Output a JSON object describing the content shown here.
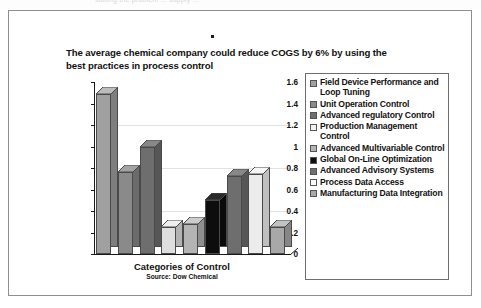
{
  "page": {
    "scan_artifact_text": "stating the problem ... supply ...",
    "top_marker": "•"
  },
  "chart_data": {
    "type": "bar",
    "title": "The average chemical company could reduce COGS by 6% by using the best practices in process control",
    "xlabel": "Categories of Control",
    "ylabel": "",
    "source": "Source: Dow Chemical",
    "ylim": [
      0,
      1.6
    ],
    "ytick_labels": [
      "0",
      "0.2",
      "0.4",
      "0.6",
      "0.8",
      "1",
      "1.2",
      "1.4",
      "1.6"
    ],
    "ytick_values": [
      0,
      0.2,
      0.4,
      0.6,
      0.8,
      1,
      1.2,
      1.4,
      1.6
    ],
    "grid": true,
    "legend_position": "right",
    "categories": [
      "Field Device Performance and Loop Tuning",
      "Unit Operation Control",
      "Advanced regulatory Control",
      "Production Management Control",
      "Advanced Multivariable Control",
      "Global On-Line Optimization",
      "Advanced Advisory Systems",
      "Process Data Access",
      "Manufacturing Data Integration"
    ],
    "values": [
      1.49,
      0.76,
      1.0,
      0.25,
      0.28,
      0.5,
      0.73,
      0.74,
      0.25
    ],
    "colors": [
      "#a0a0a0",
      "#8a8a8a",
      "#6e6e6e",
      "#dedede",
      "#b4b4b4",
      "#0d0d0d",
      "#6e6e6e",
      "#ececec",
      "#a8a8a8"
    ],
    "side_colors": [
      "#7e7e7e",
      "#6b6b6b",
      "#565656",
      "#b3b3b3",
      "#8f8f8f",
      "#0a0a0a",
      "#565656",
      "#bfbfbf",
      "#868686"
    ],
    "top_colors": [
      "#bcbcbc",
      "#a3a3a3",
      "#888888",
      "#efefef",
      "#cccccc",
      "#2a2a2a",
      "#888888",
      "#f7f7f7",
      "#c2c2c2"
    ]
  },
  "legend": {
    "items": [
      {
        "label": "Field Device Performance and Loop Tuning",
        "color": "#a0a0a0"
      },
      {
        "label": "Unit Operation Control",
        "color": "#8a8a8a"
      },
      {
        "label": "Advanced regulatory Control",
        "color": "#6e6e6e"
      },
      {
        "label": "Production Management Control",
        "color": "#f2f2f2"
      },
      {
        "label": "Advanced Multivariable Control",
        "color": "#b4b4b4"
      },
      {
        "label": "Global On-Line Optimization",
        "color": "#0d0d0d"
      },
      {
        "label": "Advanced Advisory Systems",
        "color": "#6e6e6e"
      },
      {
        "label": "Process Data Access",
        "color": "#fafafa"
      },
      {
        "label": "Manufacturing Data Integration",
        "color": "#a8a8a8"
      }
    ]
  }
}
